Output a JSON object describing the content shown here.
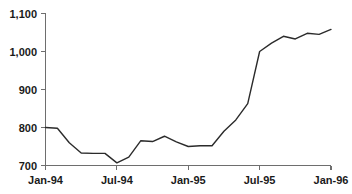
{
  "chart_data": {
    "type": "line",
    "title": "",
    "subtitle": "",
    "xlabel": "",
    "ylabel": "",
    "grid": false,
    "legend": false,
    "legend_position": "none",
    "line_color": "#2b2b2b",
    "axis_color": "#6e6e6e",
    "background_color": "#ffffff",
    "ylim": [
      700,
      1100
    ],
    "y_ticks": [
      700,
      800,
      900,
      1000,
      1100
    ],
    "y_tick_labels": [
      "700",
      "800",
      "900",
      "1,000",
      "1,100"
    ],
    "x_ticks": [
      "Jan-94",
      "Jul-94",
      "Jan-95",
      "Jul-95",
      "Jan-96"
    ],
    "x_tick_labels": [
      "Jan-94",
      "Jul-94",
      "Jan-95",
      "Jul-95",
      "Jan-96"
    ],
    "x": [
      "Jan-94",
      "Feb-94",
      "Mar-94",
      "Apr-94",
      "May-94",
      "Jun-94",
      "Jul-94",
      "Aug-94",
      "Sep-94",
      "Oct-94",
      "Nov-94",
      "Dec-94",
      "Jan-95",
      "Feb-95",
      "Mar-95",
      "Apr-95",
      "May-95",
      "Jun-95",
      "Jul-95",
      "Aug-95",
      "Sep-95",
      "Oct-95",
      "Nov-95",
      "Dec-95",
      "Jan-96"
    ],
    "values": [
      800,
      798,
      760,
      733,
      732,
      732,
      707,
      722,
      765,
      763,
      777,
      762,
      750,
      752,
      752,
      790,
      820,
      863,
      1000,
      1022,
      1040,
      1033,
      1048,
      1045,
      1058
    ],
    "series": [
      {
        "name": "series-1",
        "values": [
          800,
          798,
          760,
          733,
          732,
          732,
          707,
          722,
          765,
          763,
          777,
          762,
          750,
          752,
          752,
          790,
          820,
          863,
          1000,
          1022,
          1040,
          1033,
          1048,
          1045,
          1058
        ]
      }
    ]
  },
  "axes": {
    "y_tick_labels": [
      "1,100",
      "1,000",
      "900",
      "800",
      "700"
    ],
    "x_tick_labels": [
      "Jan-94",
      "Jul-94",
      "Jan-95",
      "Jul-95",
      "Jan-96"
    ]
  }
}
